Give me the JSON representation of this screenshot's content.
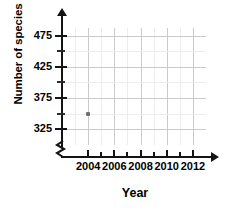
{
  "chart_data": {
    "type": "scatter",
    "title": "",
    "xlabel": "Year",
    "ylabel": "Number of species",
    "xlim": [
      2002,
      2013
    ],
    "ylim": [
      300,
      487
    ],
    "grid": true,
    "legend_position": "none",
    "x_tick_labels": [
      "2004",
      "2006",
      "2008",
      "2010",
      "2012"
    ],
    "x_tick_values": [
      2004,
      2006,
      2008,
      2010,
      2012
    ],
    "x_minor_tick_values": [
      2005,
      2007,
      2009,
      2011
    ],
    "y_tick_labels": [
      "325",
      "375",
      "425",
      "475"
    ],
    "y_tick_values": [
      325,
      375,
      425,
      475
    ],
    "y_minor_tick_values": [
      350,
      400,
      450
    ],
    "y_axis_break": true,
    "point_color": "#6d6f71",
    "points": [
      {
        "x": 2004,
        "y": 350,
        "label": "(2004, 350)"
      }
    ]
  },
  "axis_titles": {
    "y": "Number of species",
    "x": "Year"
  }
}
